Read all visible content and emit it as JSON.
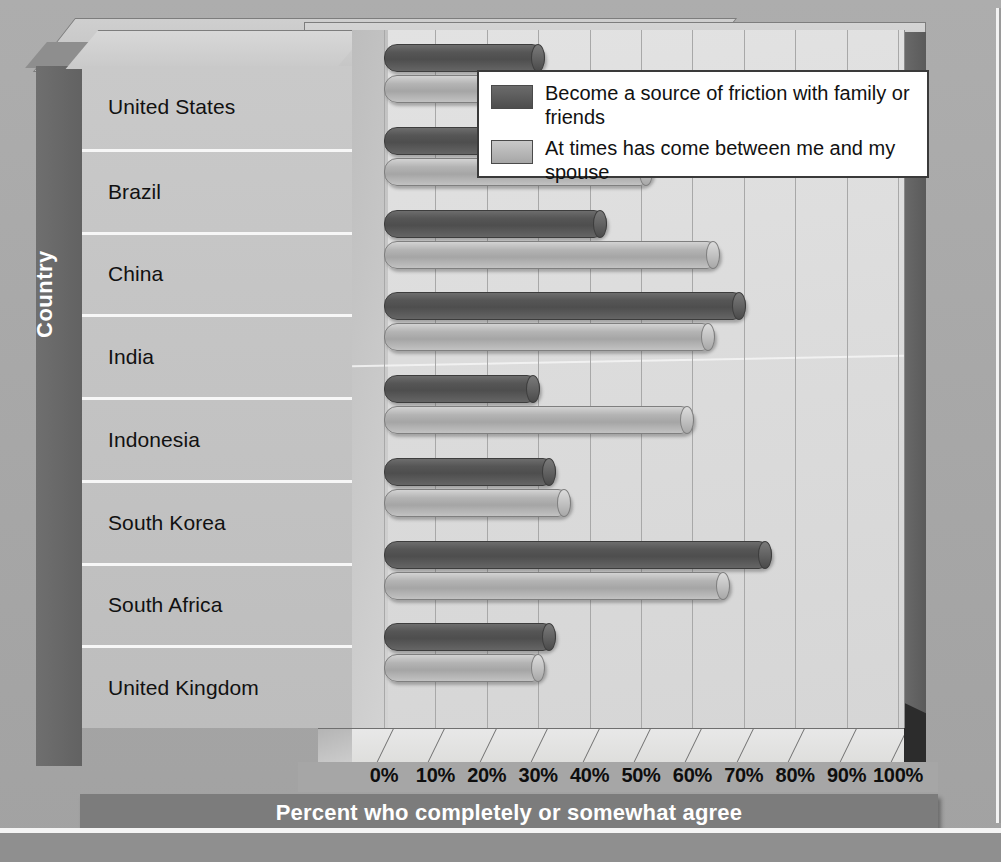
{
  "chart_data": {
    "type": "bar",
    "orientation": "horizontal",
    "title": "",
    "xlabel": "Percent who completely or somewhat agree",
    "ylabel": "Country",
    "categories": [
      "United States",
      "Brazil",
      "China",
      "India",
      "Indonesia",
      "South Korea",
      "South Africa",
      "United Kingdom"
    ],
    "series": [
      {
        "name": "Become a source of friction with family or friends",
        "color": "#545454",
        "values": [
          31,
          39,
          43,
          70,
          30,
          33,
          75,
          33
        ]
      },
      {
        "name": "At times has come between me and my spouse",
        "color": "#b0b0b0",
        "values": [
          28,
          52,
          65,
          64,
          60,
          36,
          67,
          31
        ]
      }
    ],
    "xlim": [
      0,
      100
    ],
    "xticks": [
      0,
      10,
      20,
      30,
      40,
      50,
      60,
      70,
      80,
      90,
      100
    ],
    "xtick_labels": [
      "0%",
      "10%",
      "20%",
      "30%",
      "40%",
      "50%",
      "60%",
      "70%",
      "80%",
      "90%",
      "100%"
    ],
    "grid": true,
    "legend_position": "top-right"
  },
  "axes": {
    "y_axis_title": "Country",
    "x_axis_title": "Percent who completely or somewhat agree"
  },
  "legend": {
    "items": [
      {
        "label": "Become a source of friction with family or friends",
        "swatch": "dark-swatch"
      },
      {
        "label": "At times has come between me and my spouse",
        "swatch": "light-swatch"
      }
    ]
  },
  "colors": {
    "series_dark": "#545454",
    "series_light": "#b0b0b0",
    "plot_background": "#dcdcdc",
    "frame": "#7c7c7c",
    "page_background": "#a9a9a9"
  }
}
